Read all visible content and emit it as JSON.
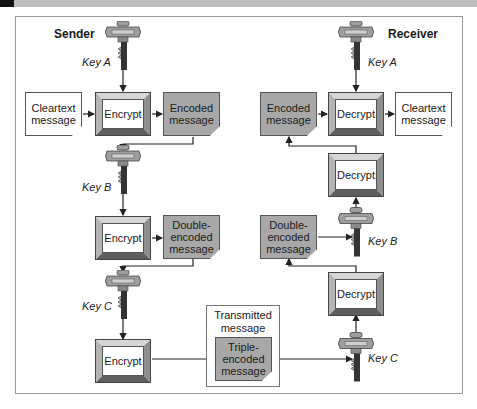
{
  "title_band": {
    "color": "#bdbdbd"
  },
  "colors": {
    "encoded_fill": "#a8a8a8",
    "key_fill": "#9e9e9e",
    "line": "#222222",
    "frame": "#9a9a9a"
  },
  "sender": {
    "label": "Sender",
    "keys": [
      {
        "icon": "key-icon",
        "label": "Key A"
      },
      {
        "icon": "key-icon",
        "label": "Key B"
      },
      {
        "icon": "key-icon",
        "label": "Key C"
      }
    ],
    "cleartext": "Cleartext message",
    "cleartext_lines": [
      "Cleartext",
      "message"
    ],
    "encrypt_label": "Encrypt",
    "encoded_lines": [
      "Encoded",
      "message"
    ],
    "double_lines": [
      "Double-",
      "encoded",
      "message"
    ]
  },
  "transmitted": {
    "label_lines": [
      "Transmitted",
      "message"
    ],
    "triple_lines": [
      "Triple-",
      "encoded",
      "message"
    ]
  },
  "receiver": {
    "label": "Receiver",
    "keys": [
      {
        "icon": "key-icon",
        "label": "Key A"
      },
      {
        "icon": "key-icon",
        "label": "Key B"
      },
      {
        "icon": "key-icon",
        "label": "Key C"
      }
    ],
    "decrypt_label": "Decrypt",
    "encoded_lines": [
      "Encoded",
      "message"
    ],
    "cleartext_lines": [
      "Cleartext",
      "message"
    ],
    "double_lines": [
      "Double-",
      "encoded",
      "message"
    ]
  }
}
